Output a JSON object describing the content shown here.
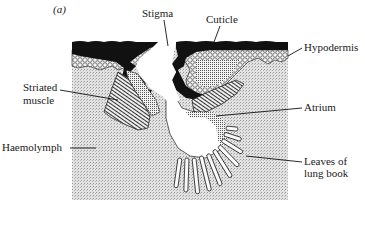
{
  "figure": {
    "panel_label": "(a)",
    "labels": {
      "stigma": "Stigma",
      "cuticle": "Cuticle",
      "hypodermis": "Hypodermis",
      "striated_muscle_line1": "Striated",
      "striated_muscle_line2": "muscle",
      "atrium": "Atrium",
      "haemolymph": "Haemolymph",
      "leaves_line1": "Leaves of",
      "leaves_line2": "lung book"
    }
  },
  "colors": {
    "cuticle": "#111111",
    "haemolymph": "#d4d4d4",
    "hypodermis": "#bdbdbd",
    "ink": "#1a1a1a",
    "background": "#ffffff"
  }
}
